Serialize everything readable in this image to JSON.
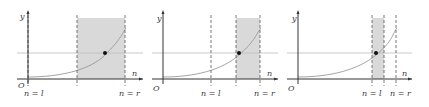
{
  "colors": {
    "axis": "#333333",
    "shade": "#d9d9d9",
    "curve": "#9a9a9a",
    "hline": "#bdbdbd",
    "dashed": "#555555",
    "dot": "#111111"
  },
  "labels": {
    "y_axis": "y",
    "x_axis": "n",
    "origin": "O",
    "left_bound": "n = l",
    "right_bound": "n = r"
  },
  "panels": [
    {
      "id": "panel-1",
      "y_axis_x": 28,
      "l_x": 28,
      "mid_x": 77,
      "r_x": 125,
      "shade_from": 77,
      "shade_to": 125,
      "dot_x": 105
    },
    {
      "id": "panel-2",
      "y_axis_x": 163,
      "l_x": 211,
      "mid_x": 236,
      "r_x": 260,
      "shade_from": 236,
      "shade_to": 260,
      "dot_x": 239
    },
    {
      "id": "panel-3",
      "y_axis_x": 298,
      "l_x": 372,
      "mid_x": 384,
      "r_x": 396,
      "shade_from": 372,
      "shade_to": 384,
      "dot_x": 376
    }
  ]
}
